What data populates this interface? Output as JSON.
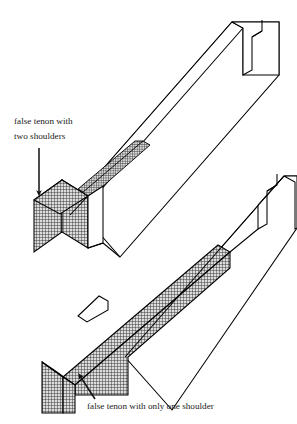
{
  "figure": {
    "type": "technical-line-drawing",
    "background_color": "#ffffff",
    "line_color": "#000000",
    "hatch_color": "#3a3a3a",
    "hatch_fill_color": "#d8d8d8",
    "text_color": "#1a1a1a"
  },
  "annotations": [
    {
      "id": "upper",
      "lines": [
        "false tenon with",
        "two shoulders"
      ],
      "line1": "false tenon with",
      "line2": "two shoulders",
      "text_x": 14,
      "text_y": 124,
      "arrow": {
        "from_x": 39,
        "from_y": 148,
        "to_x": 39,
        "to_y": 196,
        "direction": "down"
      }
    },
    {
      "id": "lower",
      "lines": [
        "false tenon with only one shoulder"
      ],
      "line1": "false tenon with only one shoulder",
      "text_x": 87,
      "text_y": 409,
      "arrow": {
        "from_x": 95,
        "from_y": 399,
        "to_x": 79,
        "to_y": 374,
        "direction": "up-left"
      }
    }
  ],
  "parts": [
    {
      "id": "upper-board",
      "name": "upper board with false tenon with two shoulders",
      "tenon_style": "two shoulders",
      "tenon_shaded": true,
      "mortise_notch": true
    },
    {
      "id": "lower-board",
      "name": "lower board with false tenon with only one shoulder",
      "tenon_style": "one shoulder",
      "tenon_shaded": true,
      "mortise_notch": true
    }
  ]
}
